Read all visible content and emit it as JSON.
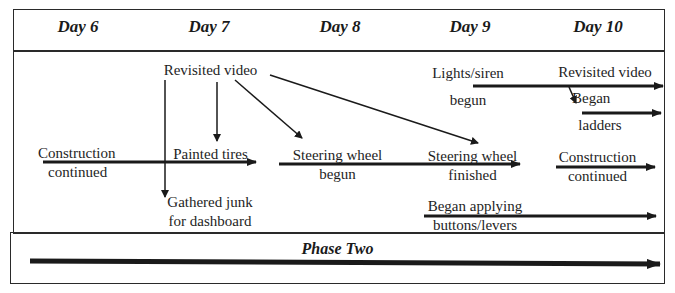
{
  "header": {
    "days": [
      "Day 6",
      "Day 7",
      "Day 8",
      "Day 9",
      "Day 10"
    ]
  },
  "events": {
    "day6_construction": [
      "Construction",
      "continued"
    ],
    "day7_revisited_video": "Revisited video",
    "day7_painted_tires": "Painted tires",
    "day7_gathered_junk": [
      "Gathered junk",
      "for dashboard"
    ],
    "day8_steering_begun": [
      "Steering wheel",
      "begun"
    ],
    "day9_lights_siren": [
      "Lights/siren",
      "begun"
    ],
    "day9_steering_finished": [
      "Steering wheel",
      "finished"
    ],
    "day9_buttons_levers": [
      "Began applying",
      "buttons/levers"
    ],
    "day10_revisited_video": "Revisited video",
    "day10_ladders": [
      "Began",
      "ladders"
    ],
    "day10_construction": [
      "Construction",
      "continued"
    ]
  },
  "footer": {
    "phase_label": "Phase Two"
  }
}
